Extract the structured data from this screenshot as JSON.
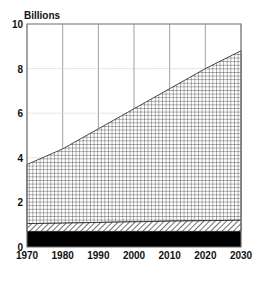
{
  "chart_data": {
    "type": "area",
    "stacked": true,
    "title": "",
    "ylabel": "Billions",
    "xlabel": "",
    "x": [
      1970,
      1980,
      1990,
      2000,
      2010,
      2020,
      2030
    ],
    "xlim": [
      1970,
      2030
    ],
    "ylim": [
      0,
      10
    ],
    "yticks": [
      0,
      2,
      4,
      6,
      8,
      10
    ],
    "xticks": [
      1970,
      1980,
      1990,
      2000,
      2010,
      2020,
      2030
    ],
    "grid": true,
    "legend": null,
    "series": [
      {
        "name": "bottom band (solid black)",
        "pattern": "solid",
        "color": "#000000",
        "values": [
          0.7,
          0.7,
          0.7,
          0.7,
          0.7,
          0.7,
          0.7
        ]
      },
      {
        "name": "middle band (diagonal hatch)",
        "pattern": "diagonal-hatch",
        "color": "#000000",
        "values": [
          0.35,
          0.37,
          0.4,
          0.43,
          0.46,
          0.48,
          0.5
        ]
      },
      {
        "name": "top band (crosshatch grid)",
        "pattern": "crosshatch",
        "color": "#000000",
        "cumulative_top": [
          3.7,
          4.4,
          5.3,
          6.2,
          7.1,
          8.0,
          8.8
        ]
      }
    ],
    "cumulative_totals": [
      3.7,
      4.4,
      5.3,
      6.2,
      7.1,
      8.0,
      8.8
    ]
  },
  "labels": {
    "y_unit": "Billions",
    "y_ticks": [
      "0",
      "2",
      "4",
      "6",
      "8",
      "10"
    ],
    "x_ticks": [
      "1970",
      "1980",
      "1990",
      "2000",
      "2010",
      "2020",
      "2030"
    ]
  }
}
